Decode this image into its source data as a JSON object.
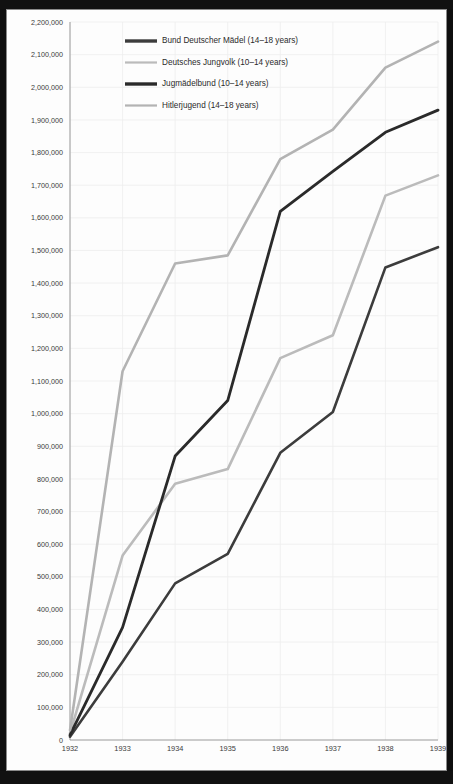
{
  "chart_data": {
    "type": "line",
    "title": "",
    "xlabel": "",
    "ylabel": "",
    "x": [
      1932,
      1933,
      1934,
      1935,
      1936,
      1937,
      1938,
      1939
    ],
    "categories": [
      "1932",
      "1933",
      "1934",
      "1935",
      "1936",
      "1937",
      "1938",
      "1939"
    ],
    "xlim": [
      1932,
      1939
    ],
    "ylim": [
      0,
      2200000
    ],
    "ytick_step": 100000,
    "grid": true,
    "legend_position": "top-center",
    "series": [
      {
        "name": "Bund Deutscher Mädel (14–18 years)",
        "color": "#3c3c3c",
        "width": 2.6,
        "values": [
          10000,
          240000,
          480000,
          570000,
          880000,
          1005000,
          1448000,
          1510000
        ]
      },
      {
        "name": "Deutsches Jungvolk (10–14 years)",
        "color": "#bbbbbb",
        "width": 2.6,
        "values": [
          20000,
          565000,
          785000,
          830000,
          1170000,
          1240000,
          1668000,
          1730000
        ]
      },
      {
        "name": "Jugmädelbund (10–14 years)",
        "color": "#2a2a2a",
        "width": 2.8,
        "values": [
          15000,
          345000,
          870000,
          1040000,
          1620000,
          1742000,
          1862000,
          1930000
        ]
      },
      {
        "name": "Hitlerjugend (14–18 years)",
        "color": "#b3b3b3",
        "width": 2.6,
        "values": [
          30000,
          1130000,
          1460000,
          1485000,
          1780000,
          1870000,
          2060000,
          2140000
        ]
      }
    ],
    "ytick_labels": [
      "0",
      "100,000",
      "200,000",
      "300,000",
      "400,000",
      "500,000",
      "600,000",
      "700,000",
      "800,000",
      "900,000",
      "1,000,000",
      "1,100,000",
      "1,200,000",
      "1,300,000",
      "1,400,000",
      "1,500,000",
      "1,600,000",
      "1,700,000",
      "1,800,000",
      "1,900,000",
      "2,000,000",
      "2,100,000",
      "2,200,000"
    ],
    "ytick_values": [
      0,
      100000,
      200000,
      300000,
      400000,
      500000,
      600000,
      700000,
      800000,
      900000,
      1000000,
      1100000,
      1200000,
      1300000,
      1400000,
      1500000,
      1600000,
      1700000,
      1800000,
      1900000,
      2000000,
      2100000,
      2200000
    ],
    "legend": [
      {
        "label": "Bund Deutscher Mädel (14–18 years)",
        "color": "#3c3c3c",
        "width": 3.4
      },
      {
        "label": "Deutsches Jungvolk (10–14 years)",
        "color": "#bbbbbb",
        "width": 2.2
      },
      {
        "label": "Jugmädelbund (10–14 years)",
        "color": "#2a2a2a",
        "width": 3.4
      },
      {
        "label": "Hitlerjugend (14–18 years)",
        "color": "#b3b3b3",
        "width": 2.2
      }
    ]
  },
  "colors": {
    "background": "#fdfdfd",
    "band": "#111111",
    "grid": "#ededed",
    "axis": "#9a9a9a",
    "text": "#3a3a3a"
  }
}
